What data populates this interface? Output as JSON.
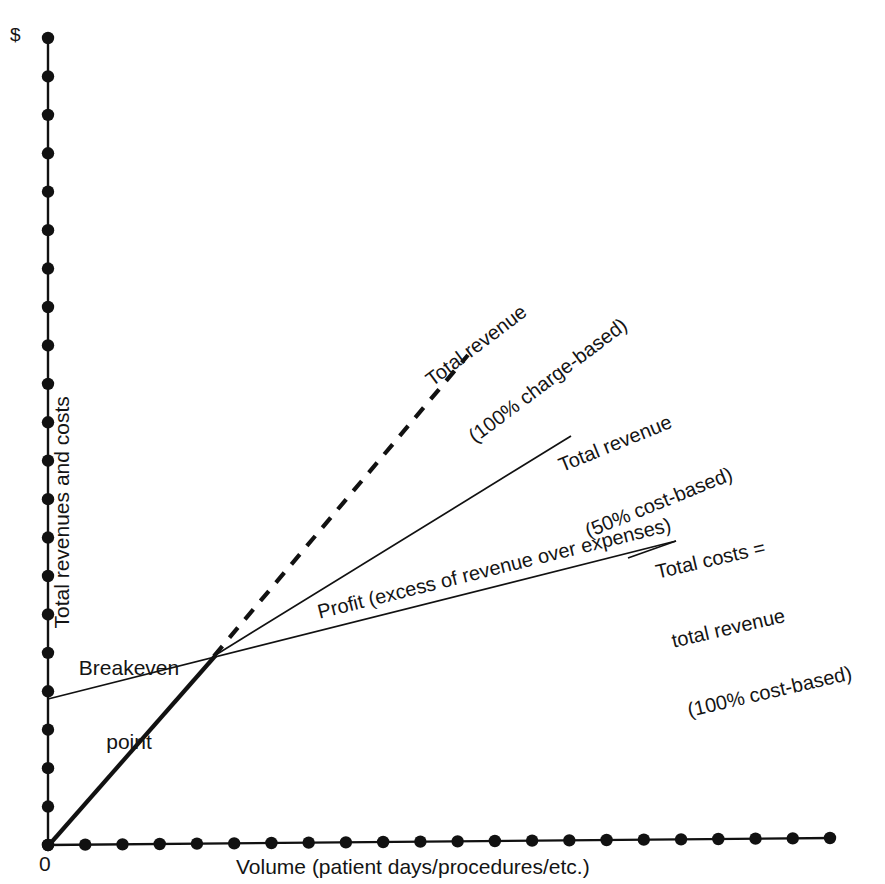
{
  "chart_data": {
    "type": "line",
    "title": "",
    "subtitle": "",
    "xlabel": "Volume (patient days/procedures/etc.)",
    "ylabel": "Total revenues and costs",
    "y_axis_unit_symbol": "$",
    "origin_label": "0",
    "xlim": [
      0,
      21
    ],
    "ylim": [
      0,
      21
    ],
    "grid": false,
    "legend_position": "inline-annotations",
    "axis_ticks": {
      "x_tick_count": 22,
      "y_tick_count": 22,
      "x_tick_labels": [],
      "y_tick_labels": [],
      "tick_style": "filled-dot"
    },
    "breakeven": {
      "label_line_1": "Breakeven",
      "label_line_2": "point",
      "x": 4.5,
      "y": 5.15
    },
    "series": [
      {
        "name": "Total revenue (100% charge-based)",
        "label_line_1": "Total revenue",
        "label_line_2": "(100% charge-based)",
        "style": "dashed",
        "width": 4,
        "color": "#111111",
        "x": [
          4.5,
          11.4
        ],
        "y": [
          5.15,
          13.1
        ]
      },
      {
        "name": "Total revenue (50% cost-based)",
        "label_line_1": "Total revenue",
        "label_line_2": "(50% cost-based)",
        "style": "solid",
        "width": 1.6,
        "color": "#111111",
        "x": [
          4.5,
          14.2
        ],
        "y": [
          5.15,
          10.7
        ]
      },
      {
        "name": "Total costs = total revenue (100% cost-based)",
        "label_line_1": "Total costs =",
        "label_line_2": "total revenue",
        "label_line_3": "(100% cost-based)",
        "style": "solid",
        "width": 1.6,
        "color": "#111111",
        "x": [
          0,
          17.0
        ],
        "y": [
          3.8,
          7.9
        ]
      },
      {
        "name": "Total costs (below breakeven, heavy segment)",
        "style": "solid",
        "width": 4,
        "color": "#111111",
        "x": [
          0,
          4.5
        ],
        "y": [
          0,
          5.15
        ]
      }
    ],
    "annotations": [
      {
        "name": "profit-region",
        "text": "Profit (excess of revenue over expenses)",
        "rotation_deg": -14
      }
    ]
  },
  "axes": {
    "y": {
      "unit": "$",
      "title": "Total revenues and costs"
    },
    "x": {
      "title": "Volume (patient days/procedures/etc.)",
      "origin": "0"
    }
  },
  "labels": {
    "breakeven_l1": "Breakeven",
    "breakeven_l2": "point",
    "charge_based_l1": "Total revenue",
    "charge_based_l2": "(100% charge-based)",
    "cost50_l1": "Total revenue",
    "cost50_l2": "(50% cost-based)",
    "cost100_l1": "Total costs =",
    "cost100_l2": "total revenue",
    "cost100_l3": "(100% cost-based)",
    "profit": "Profit (excess of revenue over expenses)"
  },
  "colors": {
    "ink": "#111111",
    "background": "#ffffff"
  }
}
